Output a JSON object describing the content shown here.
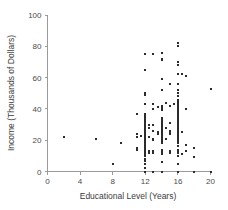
{
  "chart_data": {
    "type": "scatter",
    "title": "",
    "xlabel": "Educational Level (Years)",
    "ylabel": "Income (Thousands of Dollars)",
    "xlim": [
      0,
      20
    ],
    "ylim": [
      0,
      100
    ],
    "xticks": [
      0,
      4,
      8,
      12,
      16,
      20
    ],
    "yticks": [
      0,
      20,
      40,
      60,
      80,
      100
    ],
    "xtick_labels": [
      "0",
      "4",
      "8",
      "12",
      "16",
      "20"
    ],
    "ytick_labels": [
      "0",
      "20",
      "40",
      "60",
      "80",
      "100"
    ],
    "grid": false,
    "legend": null,
    "marker": {
      "shape": "square",
      "size_px": 2,
      "color": "#2b2b2b"
    },
    "series": [
      {
        "name": "Respondents",
        "points": [
          [
            2,
            22
          ],
          [
            6,
            21
          ],
          [
            8,
            5
          ],
          [
            9,
            18.5
          ],
          [
            11,
            37
          ],
          [
            11,
            24
          ],
          [
            11,
            22
          ],
          [
            11,
            15
          ],
          [
            11,
            14
          ],
          [
            11.5,
            22.5
          ],
          [
            12,
            75
          ],
          [
            12,
            65
          ],
          [
            12,
            50
          ],
          [
            12,
            49
          ],
          [
            12,
            43
          ],
          [
            12,
            37
          ],
          [
            12,
            36
          ],
          [
            12,
            35
          ],
          [
            12,
            34
          ],
          [
            12,
            33
          ],
          [
            12,
            32
          ],
          [
            12,
            31
          ],
          [
            12,
            30
          ],
          [
            12,
            29
          ],
          [
            12,
            28
          ],
          [
            12,
            27
          ],
          [
            12,
            26
          ],
          [
            12,
            25
          ],
          [
            12,
            24
          ],
          [
            12,
            24
          ],
          [
            12,
            23
          ],
          [
            12,
            23
          ],
          [
            12,
            22
          ],
          [
            12,
            22
          ],
          [
            12,
            21
          ],
          [
            12,
            21
          ],
          [
            12,
            20
          ],
          [
            12,
            20
          ],
          [
            12,
            19
          ],
          [
            12,
            19
          ],
          [
            12,
            18
          ],
          [
            12,
            18
          ],
          [
            12,
            17
          ],
          [
            12,
            17
          ],
          [
            12,
            16
          ],
          [
            12,
            16
          ],
          [
            12,
            15
          ],
          [
            12,
            15
          ],
          [
            12,
            14
          ],
          [
            12,
            13
          ],
          [
            12,
            12
          ],
          [
            12,
            11
          ],
          [
            12,
            10
          ],
          [
            12,
            8
          ],
          [
            12,
            7
          ],
          [
            12,
            5
          ],
          [
            12,
            2
          ],
          [
            12,
            0
          ],
          [
            12.5,
            30
          ],
          [
            12.5,
            28
          ],
          [
            12.5,
            22
          ],
          [
            12.5,
            13
          ],
          [
            12.5,
            12
          ],
          [
            13,
            75
          ],
          [
            13,
            43
          ],
          [
            13,
            40
          ],
          [
            13,
            30
          ],
          [
            13,
            26
          ],
          [
            13,
            21
          ],
          [
            13,
            20
          ],
          [
            13,
            13
          ],
          [
            13,
            12
          ],
          [
            13,
            0
          ],
          [
            13.5,
            41
          ],
          [
            13.5,
            25
          ],
          [
            13.5,
            24
          ],
          [
            14,
            76
          ],
          [
            14,
            72
          ],
          [
            14,
            71
          ],
          [
            14,
            59
          ],
          [
            14,
            52
          ],
          [
            14,
            42
          ],
          [
            14,
            41
          ],
          [
            14,
            40
          ],
          [
            14,
            39
          ],
          [
            14,
            34
          ],
          [
            14,
            33
          ],
          [
            14,
            32
          ],
          [
            14,
            31
          ],
          [
            14,
            30
          ],
          [
            14,
            29
          ],
          [
            14,
            28
          ],
          [
            14,
            27
          ],
          [
            14,
            26
          ],
          [
            14,
            25
          ],
          [
            14,
            24
          ],
          [
            14,
            23
          ],
          [
            14,
            22
          ],
          [
            14,
            21
          ],
          [
            14,
            20
          ],
          [
            14,
            19
          ],
          [
            14,
            18
          ],
          [
            14,
            14
          ],
          [
            14,
            13
          ],
          [
            14,
            12
          ],
          [
            14,
            11
          ],
          [
            14,
            6
          ],
          [
            14,
            0
          ],
          [
            14.5,
            44
          ],
          [
            14.5,
            28
          ],
          [
            14.5,
            21
          ],
          [
            15,
            56
          ],
          [
            15,
            42
          ],
          [
            15,
            31
          ],
          [
            15,
            26
          ],
          [
            15,
            25
          ],
          [
            15,
            24
          ],
          [
            15,
            13
          ],
          [
            15,
            12
          ],
          [
            15.5,
            43
          ],
          [
            16,
            82
          ],
          [
            16,
            80
          ],
          [
            16,
            70
          ],
          [
            16,
            68
          ],
          [
            16,
            62
          ],
          [
            16,
            56
          ],
          [
            16,
            52
          ],
          [
            16,
            50
          ],
          [
            16,
            48
          ],
          [
            16,
            46
          ],
          [
            16,
            45
          ],
          [
            16,
            44
          ],
          [
            16,
            43
          ],
          [
            16,
            42
          ],
          [
            16,
            41
          ],
          [
            16,
            40
          ],
          [
            16,
            40
          ],
          [
            16,
            39
          ],
          [
            16,
            38
          ],
          [
            16,
            37
          ],
          [
            16,
            36
          ],
          [
            16,
            35
          ],
          [
            16,
            34
          ],
          [
            16,
            33
          ],
          [
            16,
            32
          ],
          [
            16,
            31
          ],
          [
            16,
            30
          ],
          [
            16,
            29
          ],
          [
            16,
            28
          ],
          [
            16,
            27
          ],
          [
            16,
            26
          ],
          [
            16,
            25
          ],
          [
            16,
            24
          ],
          [
            16,
            23
          ],
          [
            16,
            22
          ],
          [
            16,
            21
          ],
          [
            16,
            20
          ],
          [
            16,
            19
          ],
          [
            16,
            18
          ],
          [
            16,
            16
          ],
          [
            16,
            14
          ],
          [
            16,
            13
          ],
          [
            16,
            12
          ],
          [
            16,
            10
          ],
          [
            16,
            5
          ],
          [
            16,
            0
          ],
          [
            16.5,
            62
          ],
          [
            16.5,
            25
          ],
          [
            16.5,
            11
          ],
          [
            17,
            61
          ],
          [
            17,
            40
          ],
          [
            17,
            17
          ],
          [
            17,
            13
          ],
          [
            18,
            15
          ],
          [
            18,
            9
          ],
          [
            18,
            0
          ],
          [
            20,
            53
          ],
          [
            20,
            0
          ]
        ]
      }
    ]
  },
  "axes": {
    "y_title": "Income (Thousands of Dollars)",
    "x_title": "Educational Level (Years)"
  }
}
